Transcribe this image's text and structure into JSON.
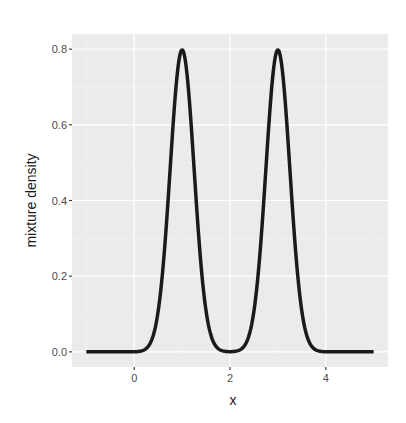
{
  "chart_data": {
    "type": "line",
    "title": "",
    "xlabel": "x",
    "ylabel": "mixture density",
    "xlim": [
      -1.3,
      5.3
    ],
    "ylim": [
      -0.04,
      0.84
    ],
    "x_ticks": [
      0,
      2,
      4
    ],
    "x_tick_labels": [
      "0",
      "2",
      "4"
    ],
    "y_ticks": [
      0.0,
      0.2,
      0.4,
      0.6,
      0.8
    ],
    "y_tick_labels": [
      "0.0",
      "0.2",
      "0.4",
      "0.6",
      "0.8"
    ],
    "x_minor_ticks": [
      -1,
      1,
      3,
      5
    ],
    "y_minor_ticks": [
      0.1,
      0.3,
      0.5,
      0.7
    ],
    "grid": true,
    "legend": "none",
    "series": [
      {
        "name": "mixture density",
        "description": "Equal-weight mixture of two normals N(1, 0.25) and N(3, 0.25)",
        "components": [
          {
            "weight": 0.5,
            "mean": 1,
            "sd": 0.25
          },
          {
            "weight": 0.5,
            "mean": 3,
            "sd": 0.25
          }
        ],
        "x_range": [
          -1,
          5
        ],
        "sample_points": [
          {
            "x": -1.0,
            "y": 0.0
          },
          {
            "x": 0.0,
            "y": 0.0003
          },
          {
            "x": 0.5,
            "y": 0.108
          },
          {
            "x": 0.75,
            "y": 0.484
          },
          {
            "x": 1.0,
            "y": 0.798
          },
          {
            "x": 1.25,
            "y": 0.484
          },
          {
            "x": 1.5,
            "y": 0.108
          },
          {
            "x": 2.0,
            "y": 0.0003
          },
          {
            "x": 2.5,
            "y": 0.108
          },
          {
            "x": 2.75,
            "y": 0.484
          },
          {
            "x": 3.0,
            "y": 0.798
          },
          {
            "x": 3.25,
            "y": 0.484
          },
          {
            "x": 3.5,
            "y": 0.108
          },
          {
            "x": 4.0,
            "y": 0.0003
          },
          {
            "x": 5.0,
            "y": 0.0
          }
        ],
        "color": "#1a1a1a",
        "line_width": 3.5
      }
    ],
    "colors": {
      "panel_background": "#ebebeb",
      "grid_major": "#ffffff",
      "grid_minor": "#f5f5f5",
      "line": "#1a1a1a",
      "tick_text": "#4d4d4d",
      "axis_title": "#1a1a1a"
    }
  }
}
